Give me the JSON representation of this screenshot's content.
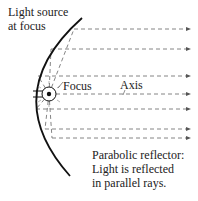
{
  "diagram": {
    "title": "Parabolic reflector",
    "labels": {
      "source_line1": "Light source",
      "source_line2": "at focus",
      "focus": "Focus",
      "axis": "Axis",
      "caption_line1": "Parabolic reflector:",
      "caption_line2": "Light is reflected",
      "caption_line3": "in parallel rays."
    },
    "rays_y": [
      29,
      49,
      76,
      85,
      109,
      129,
      138
    ],
    "colors": {
      "ink": "#111111",
      "dash": "#555555"
    }
  }
}
